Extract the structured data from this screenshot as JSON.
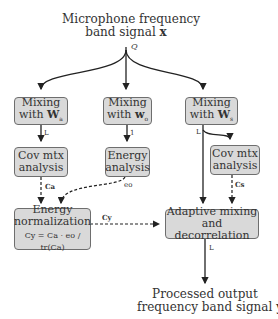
{
  "input": {
    "line1": "Microphone frequency",
    "line2": "band signal",
    "symbol": "x",
    "channels": "Q"
  },
  "boxes": {
    "mix_a": {
      "line1": "Mixing",
      "line2": "with",
      "symbol": "W",
      "sub": "a"
    },
    "mix_o": {
      "line1": "Mixing",
      "line2": "with",
      "symbol": "w",
      "sub": "o"
    },
    "mix_s": {
      "line1": "Mixing",
      "line2": "with",
      "symbol": "W",
      "sub": "s"
    },
    "cov_a": {
      "line1": "Cov mtx",
      "line2": "analysis"
    },
    "energy": {
      "line1": "Energy",
      "line2": "analysis"
    },
    "cov_s": {
      "line1": "Cov mtx",
      "line2": "analysis"
    },
    "norm": {
      "line1": "Energy",
      "line2": "normalization",
      "formula": "Cy = Ca · eo / tr(Ca)"
    },
    "adaptive": {
      "line1": "Adaptive mixing",
      "line2": "and decorrelation"
    }
  },
  "edge_labels": {
    "mix_a_out": "L",
    "mix_o_out": "1",
    "mix_s_out": "L",
    "cov_a_out": "Ca",
    "energy_out": "eo",
    "cov_s_out": "Cs",
    "norm_out": "Cy",
    "adaptive_out": "L"
  },
  "output": {
    "line1": "Processed output",
    "line2": "frequency band signal",
    "symbol": "y"
  }
}
